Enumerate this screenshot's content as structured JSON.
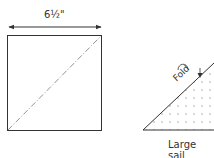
{
  "diagram": {
    "dimension_label": "6½\"",
    "fold_label": "Fold",
    "caption": "Large sail",
    "colors": {
      "line": "#333333",
      "dash": "#666666",
      "dots": "#999999"
    }
  }
}
